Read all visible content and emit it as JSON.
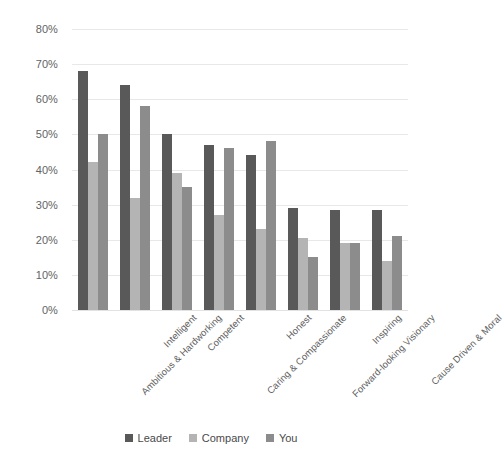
{
  "chart_data": {
    "type": "bar",
    "title": "",
    "subtitle": "",
    "xlabel": "",
    "ylabel": "",
    "ylim": [
      0,
      80
    ],
    "ytick_step": 10,
    "ytick_labels": [
      "0%",
      "10%",
      "20%",
      "30%",
      "40%",
      "50%",
      "60%",
      "70%",
      "80%"
    ],
    "ytick_values": [
      0,
      10,
      20,
      30,
      40,
      50,
      60,
      70,
      80
    ],
    "grid": true,
    "legend_position": "bottom",
    "value_suffix": "%",
    "categories": [
      "Ambitious & Hardworking",
      "Intelligent",
      "Competent",
      "Caring & Compassionate",
      "Honest",
      "Forward-looking Visionary",
      "Inspiring",
      "Cause Driven & Moral"
    ],
    "series": [
      {
        "name": "Leader",
        "color": "#595959",
        "values": [
          68,
          64,
          50,
          47,
          44,
          29,
          28.5,
          28.5
        ]
      },
      {
        "name": "Company",
        "color": "#b4b4b4",
        "values": [
          42,
          32,
          39,
          27,
          23,
          20.5,
          19,
          14
        ]
      },
      {
        "name": "You",
        "color": "#8c8c8c",
        "values": [
          50,
          58,
          35,
          46,
          48,
          15,
          19,
          21
        ]
      }
    ]
  },
  "legend": {
    "items": [
      {
        "label": "Leader",
        "color": "#595959"
      },
      {
        "label": "Company",
        "color": "#b4b4b4"
      },
      {
        "label": "You",
        "color": "#8c8c8c"
      }
    ]
  },
  "colors": {
    "background": "#ffffff",
    "gridline": "#e8e8e8",
    "text": "#5a5a5a",
    "series_leader": "#595959",
    "series_company": "#b4b4b4",
    "series_you": "#8c8c8c"
  }
}
